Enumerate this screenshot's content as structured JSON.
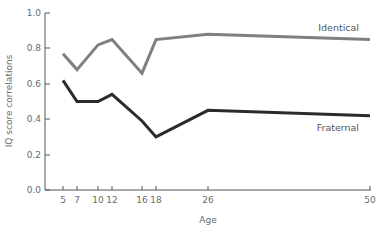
{
  "chart_data": {
    "type": "line",
    "title": "",
    "xlabel": "Age",
    "ylabel": "IQ score correlations",
    "x": [
      5,
      7,
      10,
      12,
      16,
      18,
      26,
      50
    ],
    "x_tick_labels": [
      "5",
      "7",
      "10",
      "12",
      "16",
      "18",
      "26",
      "50"
    ],
    "y_tick_labels": [
      "0.0",
      "0.2",
      "0.4",
      "0.6",
      "0.8",
      "1.0"
    ],
    "ylim": [
      0.0,
      1.0
    ],
    "grid": false,
    "legend_position": "inline-right",
    "series": [
      {
        "name": "Identical",
        "color": "#808080",
        "values": [
          0.77,
          0.68,
          0.82,
          0.85,
          0.66,
          0.85,
          0.88,
          0.85
        ]
      },
      {
        "name": "Fraternal",
        "color": "#2b2b2b",
        "values": [
          0.62,
          0.5,
          0.5,
          0.54,
          0.39,
          0.3,
          0.45,
          0.42
        ]
      }
    ]
  },
  "labels": {
    "identical": "Identical",
    "fraternal": "Fraternal",
    "xlabel": "Age",
    "ylabel": "IQ score correlations",
    "y_ticks": [
      "0.0",
      "0.2",
      "0.4",
      "0.6",
      "0.8",
      "1.0"
    ],
    "x_ticks": [
      "5",
      "7",
      "10",
      "12",
      "16",
      "18",
      "26",
      "50"
    ]
  }
}
